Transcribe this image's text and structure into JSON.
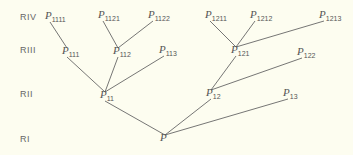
{
  "ranks": [
    {
      "label": "RIV",
      "y": 18
    },
    {
      "label": "RIII",
      "y": 51
    },
    {
      "label": "RII",
      "y": 95
    },
    {
      "label": "RI",
      "y": 140
    }
  ],
  "nodes": [
    {
      "id": "P",
      "base": "P",
      "sub": "",
      "x": 162,
      "y": 139
    },
    {
      "id": "P11",
      "base": "P",
      "sub": "11",
      "x": 102,
      "y": 96
    },
    {
      "id": "P12",
      "base": "P",
      "sub": "12",
      "x": 208,
      "y": 94
    },
    {
      "id": "P13",
      "base": "P",
      "sub": "13",
      "x": 285,
      "y": 94
    },
    {
      "id": "P111",
      "base": "P",
      "sub": "111",
      "x": 64,
      "y": 52
    },
    {
      "id": "P112",
      "base": "P",
      "sub": "112",
      "x": 115,
      "y": 52
    },
    {
      "id": "P113",
      "base": "P",
      "sub": "113",
      "x": 161,
      "y": 51
    },
    {
      "id": "P121",
      "base": "P",
      "sub": "121",
      "x": 233,
      "y": 51
    },
    {
      "id": "P122",
      "base": "P",
      "sub": "122",
      "x": 299,
      "y": 53
    },
    {
      "id": "P1111",
      "base": "P",
      "sub": "1111",
      "x": 47,
      "y": 17
    },
    {
      "id": "P1121",
      "base": "P",
      "sub": "1121",
      "x": 100,
      "y": 16
    },
    {
      "id": "P1122",
      "base": "P",
      "sub": "1122",
      "x": 150,
      "y": 16
    },
    {
      "id": "P1211",
      "base": "P",
      "sub": "1211",
      "x": 207,
      "y": 16
    },
    {
      "id": "P1212",
      "base": "P",
      "sub": "1212",
      "x": 252,
      "y": 16
    },
    {
      "id": "P1213",
      "base": "P",
      "sub": "1213",
      "x": 321,
      "y": 16
    }
  ],
  "edges": [
    [
      "P",
      "P11"
    ],
    [
      "P",
      "P12"
    ],
    [
      "P",
      "P13"
    ],
    [
      "P11",
      "P111"
    ],
    [
      "P11",
      "P112"
    ],
    [
      "P11",
      "P113"
    ],
    [
      "P12",
      "P121"
    ],
    [
      "P12",
      "P122"
    ],
    [
      "P111",
      "P1111"
    ],
    [
      "P112",
      "P1121"
    ],
    [
      "P112",
      "P1122"
    ],
    [
      "P121",
      "P1211"
    ],
    [
      "P121",
      "P1212"
    ],
    [
      "P121",
      "P1213"
    ]
  ],
  "colors": {
    "background": "#fdfdf0",
    "line": "#666666",
    "text": "#555555"
  }
}
